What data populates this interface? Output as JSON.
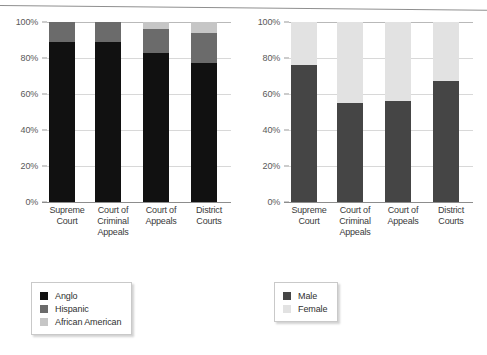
{
  "figure": {
    "background": "#ffffff",
    "axis_color": "#8d8d8d",
    "grid_color": "#d8d8d8"
  },
  "colors": {
    "anglo": "#111111",
    "hispanic": "#6b6b6b",
    "african_american": "#c6c6c6",
    "male": "#454545",
    "female": "#e2e2e2"
  },
  "chart_data": [
    {
      "type": "bar",
      "stacked": true,
      "title": "",
      "xlabel": "",
      "ylabel": "",
      "ylim": [
        0,
        100
      ],
      "yticks": [
        0,
        20,
        40,
        60,
        80,
        100
      ],
      "ytick_labels": [
        "0%",
        "20%",
        "40%",
        "60%",
        "80%",
        "100%"
      ],
      "grid": true,
      "legend_position": "below-left",
      "categories": [
        "Supreme Court",
        "Court of Criminal Appeals",
        "Court of Appeals",
        "District Courts"
      ],
      "category_lines": [
        [
          "Supreme",
          "Court"
        ],
        [
          "Court of",
          "Criminal",
          "Appeals"
        ],
        [
          "Court of",
          "Appeals"
        ],
        [
          "District",
          "Courts"
        ]
      ],
      "series": [
        {
          "name": "Anglo",
          "color": "#111111",
          "values": [
            89,
            89,
            83,
            77
          ]
        },
        {
          "name": "Hispanic",
          "color": "#6b6b6b",
          "values": [
            11,
            11,
            13,
            17
          ]
        },
        {
          "name": "African American",
          "color": "#c6c6c6",
          "values": [
            0,
            0,
            4,
            6
          ]
        }
      ]
    },
    {
      "type": "bar",
      "stacked": true,
      "title": "",
      "xlabel": "",
      "ylabel": "",
      "ylim": [
        0,
        100
      ],
      "yticks": [
        0,
        20,
        40,
        60,
        80,
        100
      ],
      "ytick_labels": [
        "0%",
        "20%",
        "40%",
        "60%",
        "80%",
        "100%"
      ],
      "grid": true,
      "legend_position": "below-left",
      "categories": [
        "Supreme Court",
        "Court of Criminal Appeals",
        "Court of Appeals",
        "District Courts"
      ],
      "category_lines": [
        [
          "Supreme",
          "Court"
        ],
        [
          "Court of",
          "Criminal",
          "Appeals"
        ],
        [
          "Court of",
          "Appeals"
        ],
        [
          "District",
          "Courts"
        ]
      ],
      "series": [
        {
          "name": "Male",
          "color": "#454545",
          "values": [
            76,
            55,
            56,
            67
          ]
        },
        {
          "name": "Female",
          "color": "#e2e2e2",
          "values": [
            24,
            45,
            44,
            33
          ]
        }
      ]
    }
  ],
  "left_chart": {
    "ytick_labels": [
      "100%",
      "80%",
      "60%",
      "40%",
      "20%",
      "0%"
    ],
    "x_labels": [
      {
        "l1": "Supreme",
        "l2": "Court",
        "l3": ""
      },
      {
        "l1": "Court of",
        "l2": "Criminal",
        "l3": "Appeals"
      },
      {
        "l1": "Court of",
        "l2": "Appeals",
        "l3": ""
      },
      {
        "l1": "District",
        "l2": "Courts",
        "l3": ""
      }
    ],
    "legend": [
      {
        "label": "Anglo",
        "color": "#111111"
      },
      {
        "label": "Hispanic",
        "color": "#6b6b6b"
      },
      {
        "label": "African American",
        "color": "#c6c6c6"
      }
    ]
  },
  "right_chart": {
    "ytick_labels": [
      "100%",
      "80%",
      "60%",
      "40%",
      "20%",
      "0%"
    ],
    "x_labels": [
      {
        "l1": "Supreme",
        "l2": "Court",
        "l3": ""
      },
      {
        "l1": "Court of",
        "l2": "Criminal",
        "l3": "Appeals"
      },
      {
        "l1": "Court of",
        "l2": "Appeals",
        "l3": ""
      },
      {
        "l1": "District",
        "l2": "Courts",
        "l3": ""
      }
    ],
    "legend": [
      {
        "label": "Male",
        "color": "#454545"
      },
      {
        "label": "Female",
        "color": "#e2e2e2"
      }
    ]
  }
}
